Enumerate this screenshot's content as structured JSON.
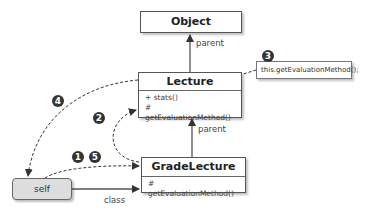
{
  "classes": {
    "object": {
      "name": "Object"
    },
    "lecture": {
      "name": "Lecture",
      "members": [
        "+ stats()",
        "# getEvaluationMethod()"
      ]
    },
    "grade_lecture": {
      "name": "GradeLecture",
      "members": [
        "# getEvaluationMethod()"
      ]
    }
  },
  "instance": {
    "name": "self"
  },
  "edges": {
    "lecture_to_object": "parent",
    "grade_to_lecture": "parent",
    "self_to_grade": "class"
  },
  "note": {
    "text": "this.getEvaluationMethod();"
  },
  "steps": [
    "1",
    "2",
    "3",
    "4",
    "5"
  ],
  "colors": {
    "line": "#333333",
    "box_fill": "#ffffff",
    "self_fill": "#dddddd",
    "badge": "#333333"
  }
}
